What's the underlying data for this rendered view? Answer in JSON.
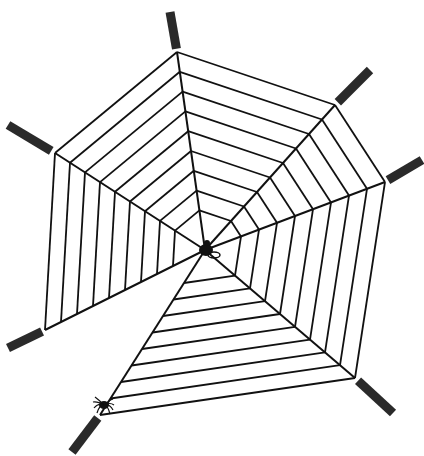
{
  "colors": {
    "line": "#111111",
    "stick": "#2a2a2a",
    "background": "#ffffff"
  },
  "center": [
    205,
    250
  ],
  "spokes": [
    {
      "name": "top",
      "end": [
        177,
        52
      ],
      "stick_end": [
        170,
        12
      ]
    },
    {
      "name": "top-right",
      "end": [
        335,
        105
      ],
      "stick_end": [
        370,
        70
      ]
    },
    {
      "name": "right",
      "end": [
        385,
        182
      ],
      "stick_end": [
        422,
        160
      ]
    },
    {
      "name": "bottom-right",
      "end": [
        355,
        378
      ],
      "stick_end": [
        393,
        413
      ]
    },
    {
      "name": "bottom-left",
      "end": [
        100,
        415
      ],
      "stick_end": [
        72,
        452
      ]
    },
    {
      "name": "left-lower",
      "end": [
        45,
        330
      ],
      "stick_end": [
        8,
        348
      ]
    },
    {
      "name": "left-upper",
      "end": [
        55,
        153
      ],
      "stick_end": [
        8,
        125
      ]
    }
  ],
  "ring_fractions": [
    0.2,
    0.3,
    0.4,
    0.5,
    0.6,
    0.7,
    0.8,
    0.9,
    1.0
  ],
  "empty_sectors": [
    [
      4,
      5
    ]
  ],
  "fly": {
    "label": "fly",
    "position": [
      208,
      250
    ]
  },
  "spider": {
    "label": "spider",
    "position": [
      104,
      405
    ]
  }
}
